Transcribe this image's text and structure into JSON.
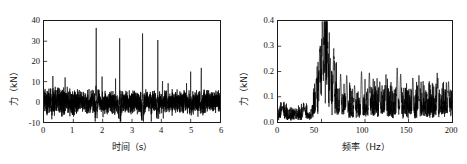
{
  "figure": {
    "panels": [
      "time-domain",
      "frequency-domain"
    ]
  },
  "chart_data": [
    {
      "id": "time-domain",
      "type": "line",
      "title": "",
      "xlabel": "时间（s）",
      "ylabel": "力（kN）",
      "xlim": [
        0,
        6
      ],
      "ylim": [
        -10,
        40
      ],
      "xticks": [
        0,
        1,
        2,
        3,
        4,
        5,
        6
      ],
      "xticklabels": [
        "0",
        "1",
        "2",
        "3",
        "4",
        "5",
        "6"
      ],
      "yticks": [
        -10,
        0,
        10,
        20,
        30,
        40
      ],
      "yticklabels": [
        "-10",
        "0",
        "10",
        "20",
        "30",
        "40"
      ],
      "grid": false,
      "legend": null,
      "series": [
        {
          "name": "力",
          "color": "#000000",
          "description": "Impact force time history: dense zero-mean noise band roughly ±5 kN with periodic sharp impact spikes",
          "noise_band": [
            -5.5,
            5.5
          ],
          "peaks": [
            {
              "t": 0.3,
              "value": 11.0
            },
            {
              "t": 0.72,
              "value": 10.0
            },
            {
              "t": 1.78,
              "value": 36.2
            },
            {
              "t": 1.98,
              "value": 11.0
            },
            {
              "t": 2.44,
              "value": 13.0
            },
            {
              "t": 2.58,
              "value": 34.2
            },
            {
              "t": 3.36,
              "value": 36.0
            },
            {
              "t": 3.88,
              "value": 33.8
            },
            {
              "t": 4.04,
              "value": 13.2
            },
            {
              "t": 4.86,
              "value": 11.0
            },
            {
              "t": 5.0,
              "value": 16.0
            },
            {
              "t": 5.36,
              "value": 20.2
            }
          ]
        }
      ]
    },
    {
      "id": "frequency-domain",
      "type": "line",
      "title": "",
      "xlabel": "频率（Hz）",
      "ylabel": "力（kN）",
      "xlim": [
        0,
        200
      ],
      "ylim": [
        0.0,
        0.4
      ],
      "xticks": [
        0,
        50,
        100,
        150,
        200
      ],
      "xticklabels": [
        "0",
        "50",
        "100",
        "150",
        "200"
      ],
      "yticks": [
        0.0,
        0.1,
        0.2,
        0.3,
        0.4
      ],
      "yticklabels": [
        "0.0",
        "0.1",
        "0.2",
        "0.3",
        "0.4"
      ],
      "grid": false,
      "legend": null,
      "series": [
        {
          "name": "力",
          "color": "#000000",
          "description": "Amplitude spectrum: low level below 40 Hz, dominant band 45-65 Hz peaking near 0.38 kN at 51 Hz, broadband 0.08-0.20 kN above 70 Hz",
          "peaks": [
            {
              "f": 5,
              "value": 0.055
            },
            {
              "f": 30,
              "value": 0.055
            },
            {
              "f": 44,
              "value": 0.17
            },
            {
              "f": 48,
              "value": 0.29
            },
            {
              "f": 51,
              "value": 0.38
            },
            {
              "f": 53,
              "value": 0.33
            },
            {
              "f": 57,
              "value": 0.3
            },
            {
              "f": 60,
              "value": 0.23
            },
            {
              "f": 64,
              "value": 0.28
            },
            {
              "f": 72,
              "value": 0.19
            },
            {
              "f": 79,
              "value": 0.185
            },
            {
              "f": 88,
              "value": 0.145
            },
            {
              "f": 96,
              "value": 0.2
            },
            {
              "f": 105,
              "value": 0.195
            },
            {
              "f": 117,
              "value": 0.16
            },
            {
              "f": 124,
              "value": 0.155
            },
            {
              "f": 137,
              "value": 0.215
            },
            {
              "f": 141,
              "value": 0.19
            },
            {
              "f": 155,
              "value": 0.175
            },
            {
              "f": 162,
              "value": 0.185
            },
            {
              "f": 183,
              "value": 0.195
            },
            {
              "f": 196,
              "value": 0.16
            }
          ],
          "baseline_low_band": 0.03,
          "baseline_high_band": 0.09
        }
      ]
    }
  ]
}
